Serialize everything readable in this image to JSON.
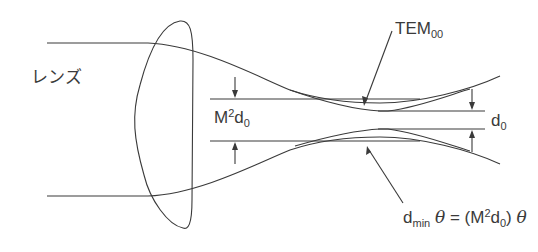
{
  "diagram": {
    "type": "optics-beam-propagation",
    "labels": {
      "lens": "レンズ",
      "tem_base": "TEM",
      "tem_sub": "00",
      "m2d0_base": "M",
      "m2d0_sup": "2",
      "m2d0_d": "d",
      "m2d0_sub": "0",
      "d0_base": "d",
      "d0_sub": "0",
      "formula_d": "d",
      "formula_min": "min",
      "formula_theta1": "θ",
      "formula_eq": " = (M",
      "formula_sup": "2",
      "formula_d2": "d",
      "formula_sub0": "0",
      "formula_close": ") ",
      "formula_theta2": "θ"
    },
    "elements": [
      {
        "name": "lens",
        "shape": "asymmetric convex lens outline"
      },
      {
        "name": "real-beam",
        "description": "multimode beam envelope focused to waist width M²d0"
      },
      {
        "name": "tem00-beam",
        "description": "Gaussian TEM00 beam focused to waist width d0"
      },
      {
        "name": "m2d0-dimension",
        "description": "dimension arrows marking M²d0 waist"
      },
      {
        "name": "d0-dimension",
        "description": "dimension arrows marking d0 waist"
      }
    ],
    "colors": {
      "stroke": "#3a3a3a",
      "background": "#ffffff"
    }
  }
}
